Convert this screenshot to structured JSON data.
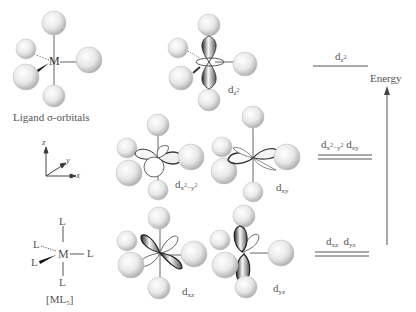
{
  "ligand_panel": {
    "caption": "Ligand σ-orbitals",
    "metal_label": "M"
  },
  "axes": {
    "z": "z",
    "y": "y",
    "x": "x"
  },
  "ml5": {
    "metal": "M",
    "ligand": "L",
    "formula": "[ML5]"
  },
  "orbitals": {
    "dz2": {
      "base": "d",
      "sub": "z",
      "sup": "2"
    },
    "dx2y2": {
      "base": "d",
      "sub": "x",
      "sup1": "2",
      "mid": "−y",
      "sup2": "2"
    },
    "dxy": {
      "base": "d",
      "sub": "xy"
    },
    "dxz": {
      "base": "d",
      "sub": "xz"
    },
    "dyz": {
      "base": "d",
      "sub": "yz"
    }
  },
  "energy_diagram": {
    "axis_label": "Energy",
    "levels": [
      {
        "label_base": "d",
        "label_sub": "z",
        "label_sup": "2",
        "degenerate": 1
      },
      {
        "label_a": "d",
        "label_a_sub": "x",
        "label_a_sup": "2",
        "label_a_mid": "−y",
        "label_a_sup2": "2",
        "label_b": "d",
        "label_b_sub": "xy",
        "degenerate": 2
      },
      {
        "label_a": "d",
        "label_a_sub": "xz",
        "label_b": "d",
        "label_b_sub": "yz",
        "degenerate": 2
      }
    ]
  },
  "colors": {
    "sphere_light": "#f4f4f4",
    "sphere_dark": "#a8a8a8",
    "line": "#555555",
    "lobe_dark": "#333333"
  }
}
